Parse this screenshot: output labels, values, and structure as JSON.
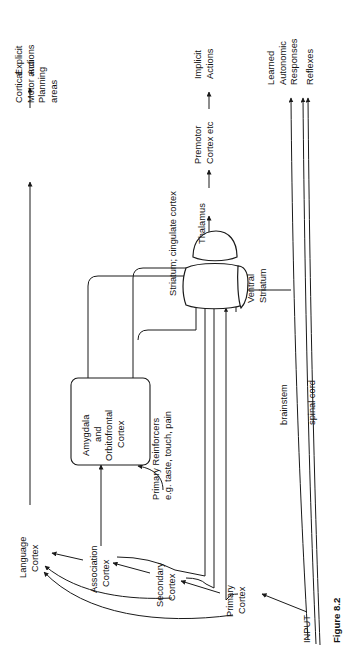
{
  "figure": {
    "caption": "Figure 8.2",
    "orientation": "rotated-90-ccw"
  },
  "nodes": {
    "cortical_motor": {
      "line1": "Cortical",
      "line2": "Motor and",
      "line3": "Planning",
      "line4": "areas"
    },
    "explicit_actions": {
      "line1": "Explicit",
      "line2": "Actions"
    },
    "premotor_cortex": {
      "line1": "Premotor",
      "line2": "Cortex etc"
    },
    "implicit_actions": {
      "line1": "Implicit",
      "line2": "Actions"
    },
    "learned_autonomic": {
      "line1": "Learned",
      "line2": "Autonomic",
      "line3": "Responses"
    },
    "reflexes": {
      "line1": "Reflexes"
    },
    "thalamus": {
      "line1": "Thalamus"
    },
    "striatum_cingulate": {
      "line1": "Striatum; cingulate cortex"
    },
    "ventral_striatum": {
      "line1": "Ventral",
      "line2": "Striatum"
    },
    "amygdala_box": {
      "line1": "Amygdala",
      "line2": "and",
      "line3": "Orbitofrontal",
      "line4": "Cortex"
    },
    "primary_reinforcers": {
      "line1": "Primary Reinforcers",
      "line2": "e.g. taste, touch, pain"
    },
    "language_cortex": {
      "line1": "Language",
      "line2": "Cortex"
    },
    "association_cortex": {
      "line1": "Association",
      "line2": "Cortex"
    },
    "secondary_cortex": {
      "line1": "Secondary",
      "line2": "Cortex"
    },
    "primary_cortex": {
      "line1": "Primary",
      "line2": "Cortex"
    },
    "brainstem": {
      "line1": "brainstem"
    },
    "spinal_cord": {
      "line1": "spinal cord"
    },
    "input": {
      "line1": "INPUT"
    }
  },
  "colors": {
    "stroke": "#1a1a1a",
    "text": "#111111",
    "background": "#ffffff"
  }
}
